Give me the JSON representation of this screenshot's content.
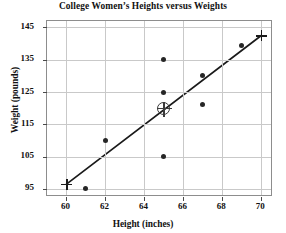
{
  "chart_data": {
    "type": "scatter",
    "title": "College Women’s Heights versus Weights",
    "xlabel": "Height (inches)",
    "ylabel": "Weight (pounds)",
    "xlim": [
      59,
      70.6
    ],
    "ylim": [
      92.5,
      147
    ],
    "grid": true,
    "legend": null,
    "xticks": [
      60,
      62,
      64,
      66,
      68,
      70
    ],
    "xtick_labels": [
      "60",
      "62",
      "64",
      "66",
      "68",
      "70"
    ],
    "yticks": [
      95,
      105,
      115,
      125,
      135,
      145
    ],
    "ytick_labels": [
      "95",
      "105",
      "115",
      "125",
      "135",
      "145"
    ],
    "series": [
      {
        "name": "Data points",
        "marker": "filled-circle",
        "color": "#262626",
        "points": [
          {
            "x": 61,
            "y": 95
          },
          {
            "x": 62,
            "y": 110
          },
          {
            "x": 65,
            "y": 105
          },
          {
            "x": 65,
            "y": 125
          },
          {
            "x": 65,
            "y": 135
          },
          {
            "x": 67,
            "y": 121
          },
          {
            "x": 67,
            "y": 130
          },
          {
            "x": 69,
            "y": 139.5
          }
        ]
      },
      {
        "name": "Mean point",
        "marker": "circled-cross",
        "color": "#3a3a3a",
        "points": [
          {
            "x": 65,
            "y": 120
          }
        ]
      },
      {
        "name": "Line endpoints",
        "marker": "plus",
        "color": "#1a1a1a",
        "points": [
          {
            "x": 60,
            "y": 96.5
          },
          {
            "x": 70,
            "y": 142.5
          }
        ]
      }
    ],
    "fit_line": {
      "name": "Line of best fit",
      "color": "#1a1a1a",
      "x1": 60,
      "y1": 96.5,
      "x2": 70,
      "y2": 142.5
    }
  }
}
